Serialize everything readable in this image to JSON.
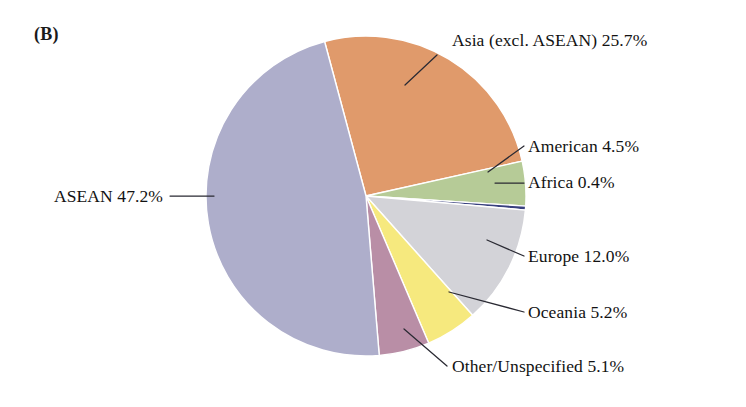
{
  "figure": {
    "panel_label": "(B)",
    "background_color": "#ffffff",
    "text_color": "#121212",
    "leader_color": "#2a2a33"
  },
  "chart_data": {
    "type": "pie",
    "title": "(B)",
    "xlabel": "",
    "ylabel": "",
    "legend_position": "outside-callout-labels",
    "grid": false,
    "units": "percent",
    "total": 100.1,
    "start_angle_deg": -15,
    "direction": "clockwise",
    "categories": [
      "Asia (excl. ASEAN)",
      "American",
      "Africa",
      "Europe",
      "Oceania",
      "Other/Unspecified",
      "ASEAN"
    ],
    "values": [
      25.7,
      4.5,
      0.4,
      12.0,
      5.2,
      5.1,
      47.2
    ],
    "colors": [
      "#e09a6b",
      "#b6cb97",
      "#38407e",
      "#d3d3d8",
      "#f6e97e",
      "#b98ea6",
      "#aeaecb"
    ],
    "slices": [
      {
        "name": "Asia (excl. ASEAN)",
        "value": 25.7,
        "label": "Asia (excl. ASEAN) 25.7%",
        "color": "#e09a6b",
        "label_x": 452,
        "label_y": 46,
        "label_anchor": "start",
        "leader": "437,55 405,85"
      },
      {
        "name": "American",
        "value": 4.5,
        "label": "American 4.5%",
        "color": "#b6cb97",
        "label_x": 528,
        "label_y": 152,
        "label_anchor": "start",
        "leader": "524,146 488,172"
      },
      {
        "name": "Africa",
        "value": 0.4,
        "label": "Africa 0.4%",
        "color": "#38407e",
        "label_x": 528,
        "label_y": 188,
        "label_anchor": "start",
        "leader": "524,183 495,183"
      },
      {
        "name": "Europe",
        "value": 12.0,
        "label": "Europe 12.0%",
        "color": "#d3d3d8",
        "label_x": 528,
        "label_y": 262,
        "label_anchor": "start",
        "leader": "524,256 487,240"
      },
      {
        "name": "Oceania",
        "value": 5.2,
        "label": "Oceania 5.2%",
        "color": "#f6e97e",
        "label_x": 528,
        "label_y": 318,
        "label_anchor": "start",
        "leader": "524,312 449,292"
      },
      {
        "name": "Other/Unspecified",
        "value": 5.1,
        "label": "Other/Unspecified 5.1%",
        "color": "#b98ea6",
        "label_x": 452,
        "label_y": 372,
        "label_anchor": "start",
        "leader": "447,366 404,329"
      },
      {
        "name": "ASEAN",
        "value": 47.2,
        "label": "ASEAN 47.2%",
        "color": "#aeaecb",
        "label_x": 163,
        "label_y": 202,
        "label_anchor": "end",
        "leader": "170,196 214,196"
      }
    ],
    "geometry": {
      "center_x": 366,
      "center_y": 196,
      "radius": 160
    }
  }
}
